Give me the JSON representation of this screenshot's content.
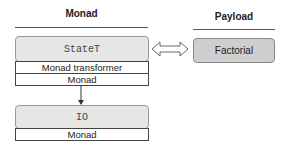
{
  "columns": {
    "monad": {
      "title": "Monad"
    },
    "payload": {
      "title": "Payload"
    }
  },
  "stack_top": {
    "name": "StateT",
    "role": "Monad transformer",
    "kind": "Monad"
  },
  "stack_bottom": {
    "name": "IO",
    "kind": "Monad"
  },
  "payload": {
    "name": "Factorial"
  },
  "icons": {
    "link": "double-arrow-icon",
    "down": "arrow-down-icon"
  }
}
